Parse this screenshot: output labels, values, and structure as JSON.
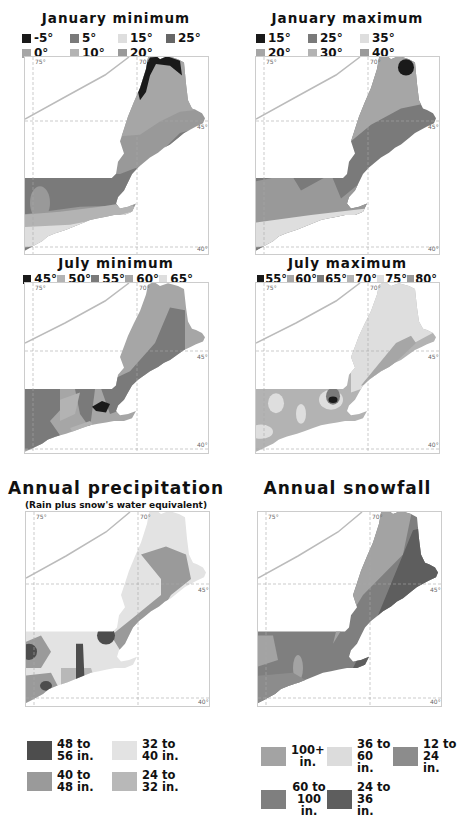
{
  "colors": {
    "black": "#1a1a1a",
    "dark": "#555555",
    "mid_dark": "#7a7a7a",
    "mid": "#999999",
    "light_mid": "#b3b3b3",
    "light": "#dedede",
    "water": "#ffffff",
    "outline": "#bbbbbb"
  },
  "degrees": {
    "lon75": "75°",
    "lon70": "70°",
    "lat45": "45°",
    "lat40": "40°"
  },
  "panels": {
    "jan_min": {
      "title": "January minimum",
      "legend": [
        {
          "label": "-5°",
          "color": "#1a1a1a"
        },
        {
          "label": "5°",
          "color": "#7a7a7a"
        },
        {
          "label": "15°",
          "color": "#dedede"
        },
        {
          "label": "25°",
          "color": "#666666"
        },
        {
          "label": "0°",
          "color": "#a6a6a6"
        },
        {
          "label": "10°",
          "color": "#b3b3b3"
        },
        {
          "label": "20°",
          "color": "#999999"
        }
      ]
    },
    "jan_max": {
      "title": "January maximum",
      "legend": [
        {
          "label": "15°",
          "color": "#1a1a1a"
        },
        {
          "label": "25°",
          "color": "#7a7a7a"
        },
        {
          "label": "35°",
          "color": "#dedede"
        },
        {
          "label": "20°",
          "color": "#a6a6a6"
        },
        {
          "label": "30°",
          "color": "#b3b3b3"
        },
        {
          "label": "40°",
          "color": "#999999"
        }
      ]
    },
    "jul_min": {
      "title": "July minimum",
      "legend": [
        {
          "label": "45°",
          "color": "#1a1a1a"
        },
        {
          "label": "50°",
          "color": "#b3b3b3"
        },
        {
          "label": "55°",
          "color": "#7a7a7a"
        },
        {
          "label": "60°",
          "color": "#a6a6a6"
        },
        {
          "label": "65°",
          "color": "#dedede"
        }
      ]
    },
    "jul_max": {
      "title": "July maximum",
      "legend": [
        {
          "label": "55°",
          "color": "#1a1a1a"
        },
        {
          "label": "60°",
          "color": "#a6a6a6"
        },
        {
          "label": "65°",
          "color": "#7a7a7a"
        },
        {
          "label": "70°",
          "color": "#b3b3b3"
        },
        {
          "label": "75°",
          "color": "#dedede"
        },
        {
          "label": "80°",
          "color": "#999999"
        }
      ]
    },
    "precip": {
      "title": "Annual precipitation",
      "subtitle": "(Rain plus snow's water equivalent)",
      "legend": [
        {
          "line1": "48 to",
          "line2": "56 in.",
          "color": "#4d4d4d"
        },
        {
          "line1": "32 to",
          "line2": "40 in.",
          "color": "#e3e3e3"
        },
        {
          "line1": "40 to",
          "line2": "48 in.",
          "color": "#9a9a9a"
        },
        {
          "line1": "24 to",
          "line2": "32 in.",
          "color": "#b8b8b8"
        }
      ]
    },
    "snow": {
      "title": "Annual snowfall",
      "legend": [
        {
          "line1": "100+",
          "line2": "in.",
          "color": "#a3a3a3"
        },
        {
          "line1": "36 to",
          "line2": "60 in.",
          "color": "#dcdcdc"
        },
        {
          "line1": "12 to",
          "line2": "24 in.",
          "color": "#8c8c8c"
        },
        {
          "line1": "60 to",
          "line2": "100 in.",
          "color": "#7f7f7f"
        },
        {
          "line1": "24 to",
          "line2": "36 in.",
          "color": "#5e5e5e"
        }
      ]
    }
  }
}
